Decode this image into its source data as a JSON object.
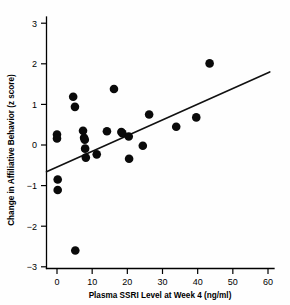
{
  "figure": {
    "background_color": "#ffffff",
    "point_color": "#0a0a0a",
    "line_color": "#111111",
    "axis_color": "#000000"
  },
  "chart_data": {
    "type": "scatter",
    "title": "",
    "subtitle": "",
    "xlabel": "Plasma SSRI Level at Week 4 (ng/ml)",
    "ylabel": "Change in Affiliative Behavior (z score)",
    "xlim": [
      -4,
      62
    ],
    "ylim": [
      -3,
      3.25
    ],
    "xticks": [
      0,
      10,
      20,
      30,
      40,
      50,
      60
    ],
    "xticklabels": [
      "0",
      "10",
      "20",
      "30",
      "40",
      "50",
      "60"
    ],
    "yticks": [
      -3,
      -2,
      -1,
      0,
      1,
      2,
      3
    ],
    "yticklabels": [
      "−3",
      "−2",
      "−1",
      "0",
      "1",
      "2",
      "3"
    ],
    "grid": false,
    "legend": null,
    "annotations": [],
    "series": [
      {
        "name": "Subjects",
        "marker": "filled-circle",
        "marker_size": 4.3,
        "points": [
          {
            "x": 0.0,
            "y": 0.26
          },
          {
            "x": 0.0,
            "y": 0.16
          },
          {
            "x": 0.2,
            "y": -0.85
          },
          {
            "x": 0.2,
            "y": -1.11
          },
          {
            "x": 4.6,
            "y": 1.19
          },
          {
            "x": 5.1,
            "y": 0.94
          },
          {
            "x": 5.2,
            "y": -2.6
          },
          {
            "x": 7.4,
            "y": 0.35
          },
          {
            "x": 7.7,
            "y": 0.18
          },
          {
            "x": 7.9,
            "y": 0.13
          },
          {
            "x": 8.0,
            "y": -0.09
          },
          {
            "x": 8.2,
            "y": -0.31
          },
          {
            "x": 11.3,
            "y": -0.23
          },
          {
            "x": 14.2,
            "y": 0.34
          },
          {
            "x": 16.2,
            "y": 1.38
          },
          {
            "x": 18.3,
            "y": 0.32
          },
          {
            "x": 18.6,
            "y": 0.29
          },
          {
            "x": 20.4,
            "y": 0.21
          },
          {
            "x": 20.5,
            "y": -0.34
          },
          {
            "x": 24.4,
            "y": -0.02
          },
          {
            "x": 26.2,
            "y": 0.75
          },
          {
            "x": 33.9,
            "y": 0.45
          },
          {
            "x": 39.6,
            "y": 0.68
          },
          {
            "x": 43.4,
            "y": 2.01
          }
        ]
      }
    ],
    "fit_line": {
      "name": "Regression line",
      "x_start": -3.0,
      "y_start": -0.66,
      "x_end": 60.5,
      "y_end": 1.8
    }
  }
}
